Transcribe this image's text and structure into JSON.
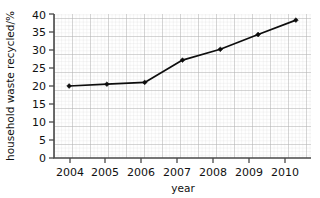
{
  "chart_data": {
    "type": "line",
    "title": "",
    "xlabel": "year",
    "ylabel": "household waste recycled/%",
    "categories": [
      "2004",
      "2005",
      "2006",
      "2007",
      "2008",
      "2009",
      "2010"
    ],
    "x": [
      2004,
      2005,
      2006,
      2007,
      2008,
      2009,
      2010
    ],
    "values": [
      20,
      20.5,
      21,
      27.2,
      30.2,
      34.3,
      38.3
    ],
    "series": [
      {
        "name": "household waste recycled",
        "values": [
          20,
          20.5,
          21,
          27.2,
          30.2,
          34.3,
          38.3
        ]
      }
    ],
    "ylim": [
      0,
      40
    ],
    "xlim": [
      2003.6,
      2010.4
    ],
    "yticks": [
      0,
      5,
      10,
      15,
      20,
      25,
      30,
      35,
      40
    ],
    "ytick_labels": [
      "0",
      "5",
      "10",
      "15",
      "20",
      "25",
      "30",
      "35",
      "40"
    ],
    "xticks": [
      2004,
      2005,
      2006,
      2007,
      2008,
      2009,
      2010
    ],
    "xtick_labels": [
      "2004",
      "2005",
      "2006",
      "2007",
      "2008",
      "2009",
      "2010"
    ],
    "grid": true,
    "grid_style": "graph-paper",
    "minor_grid": true,
    "legend": false,
    "legend_position": "none",
    "line_color": "#0d0d0d",
    "marker": "diamond",
    "marker_color": "#0d0d0d",
    "grid_major_color": "#b4b4b4",
    "grid_minor_color": "#dcdcdc",
    "background_color": "#ffffff",
    "axis_color": "#4a4a4a"
  }
}
